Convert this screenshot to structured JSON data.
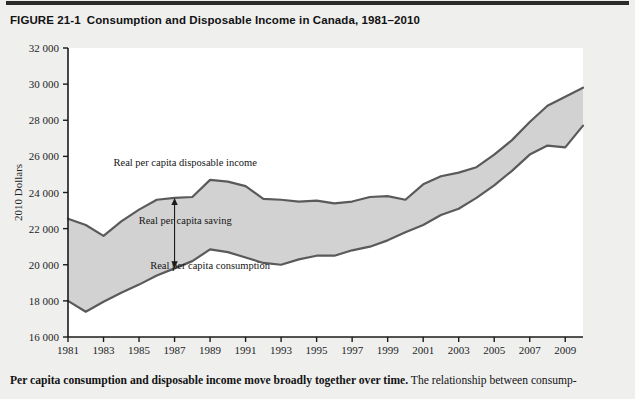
{
  "figure": {
    "number": "FIGURE 21-1",
    "title": "Consumption and Disposable Income in Canada, 1981–2010",
    "caption_bold": "Per capita consumption and disposable income move broadly together over time.",
    "caption_rest": " The relationship between consump-"
  },
  "chart_data": {
    "type": "area",
    "title": "Consumption and Disposable Income in Canada, 1981–2010",
    "xlabel": "Year",
    "ylabel": "2010 Dollars",
    "xlim": [
      1981,
      2010
    ],
    "ylim": [
      16000,
      32000
    ],
    "ytick_step": 2000,
    "xtick_step": 2,
    "grid": false,
    "legend_position": "inline-annotations",
    "ytick_labels": [
      "16 000",
      "18 000",
      "20 000",
      "22 000",
      "24 000",
      "26 000",
      "28 000",
      "30 000",
      "32 000"
    ],
    "xtick_labels": [
      "1981",
      "1983",
      "1985",
      "1987",
      "1989",
      "1991",
      "1993",
      "1995",
      "1997",
      "1999",
      "2001",
      "2003",
      "2005",
      "2007",
      "2009"
    ],
    "x": [
      1981,
      1982,
      1983,
      1984,
      1985,
      1986,
      1987,
      1988,
      1989,
      1990,
      1991,
      1992,
      1993,
      1994,
      1995,
      1996,
      1997,
      1998,
      1999,
      2000,
      2001,
      2002,
      2003,
      2004,
      2005,
      2006,
      2007,
      2008,
      2009,
      2010
    ],
    "series": [
      {
        "name": "Real per capita disposable income",
        "fill": "#d2d2d2",
        "stroke": "#5a5a5a",
        "values": [
          22550,
          22200,
          21600,
          22400,
          23050,
          23600,
          23700,
          23750,
          24700,
          24600,
          24350,
          23650,
          23600,
          23500,
          23550,
          23400,
          23500,
          23750,
          23800,
          23600,
          24450,
          24900,
          25100,
          25400,
          26100,
          26900,
          27900,
          28800,
          29300,
          29800
        ]
      },
      {
        "name": "Real per capita consumption",
        "fill": "#d2d2d2",
        "stroke": "#5a5a5a",
        "values": [
          18000,
          17400,
          17950,
          18450,
          18900,
          19400,
          19800,
          20200,
          20850,
          20700,
          20400,
          20100,
          20000,
          20300,
          20500,
          20500,
          20800,
          21000,
          21350,
          21800,
          22200,
          22750,
          23100,
          23700,
          24400,
          25200,
          26100,
          26600,
          26500,
          27700
        ]
      }
    ],
    "annotations": [
      {
        "id": "income-label",
        "text": "Real per capita disposable income",
        "x": 1987.6,
        "y": 25450,
        "anchor": "middle"
      },
      {
        "id": "saving-label",
        "text": "Real per capita saving",
        "x": 1987.6,
        "y": 22250,
        "anchor": "middle"
      },
      {
        "id": "consumption-label",
        "text": "Real per capita consumption",
        "x": 1989.0,
        "y": 19750,
        "anchor": "middle"
      },
      {
        "id": "saving-arrow",
        "text": "",
        "x": 1987.0,
        "y": 0,
        "anchor": "middle"
      }
    ],
    "saving_arrow": {
      "year": 1987,
      "top": 23700,
      "bottom": 19800
    }
  }
}
